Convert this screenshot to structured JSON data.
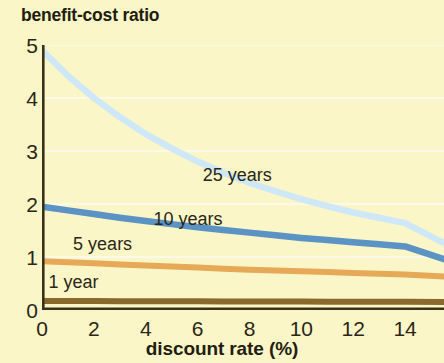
{
  "chart_data": {
    "type": "line",
    "title": "benefit-cost ratio",
    "subtitle": "",
    "xlabel": "discount rate (%)",
    "ylabel": "benefit-cost ratio",
    "xlim": [
      0,
      15.5
    ],
    "ylim": [
      0,
      5
    ],
    "xticks": [
      0,
      2,
      4,
      6,
      8,
      10,
      12,
      14
    ],
    "yticks": [
      0,
      1,
      2,
      3,
      4,
      5
    ],
    "xtick_labels": [
      "0",
      "2",
      "4",
      "6",
      "8",
      "10",
      "12",
      "14"
    ],
    "ytick_labels": [
      "0",
      "1",
      "2",
      "3",
      "4",
      "5"
    ],
    "grid": "horizontal-faint-white",
    "legend_position": "inline-annotations",
    "background_color": "#fbf6c8",
    "axis_color": "#3a3218",
    "x": [
      0,
      1,
      2,
      3,
      4,
      5,
      6,
      7,
      8,
      9,
      10,
      11,
      12,
      13,
      14,
      15.5
    ],
    "series": [
      {
        "name": "25 years",
        "label": "25 years",
        "color": "#cfe8f7",
        "values": [
          4.9,
          4.42,
          4.0,
          3.64,
          3.32,
          3.05,
          2.8,
          2.59,
          2.4,
          2.24,
          2.09,
          1.96,
          1.84,
          1.74,
          1.64,
          1.26
        ]
      },
      {
        "name": "10 years",
        "label": "10 years",
        "color": "#5a93c4",
        "values": [
          1.95,
          1.88,
          1.81,
          1.74,
          1.68,
          1.62,
          1.56,
          1.51,
          1.46,
          1.41,
          1.36,
          1.32,
          1.28,
          1.24,
          1.2,
          0.96
        ]
      },
      {
        "name": "5 years",
        "label": "5 years",
        "color": "#e6a958",
        "values": [
          0.92,
          0.9,
          0.88,
          0.86,
          0.84,
          0.82,
          0.8,
          0.78,
          0.76,
          0.745,
          0.73,
          0.715,
          0.7,
          0.685,
          0.67,
          0.63
        ]
      },
      {
        "name": "1 year",
        "label": "1 year",
        "color": "#8a6a2c",
        "values": [
          0.17,
          0.17,
          0.168,
          0.166,
          0.165,
          0.164,
          0.163,
          0.162,
          0.161,
          0.16,
          0.159,
          0.158,
          0.157,
          0.156,
          0.155,
          0.153
        ]
      }
    ],
    "annotations": [
      {
        "text": "25 years",
        "x_pct": 6.2,
        "y_value": 2.55
      },
      {
        "text": "10 years",
        "x_pct": 4.3,
        "y_value": 1.72
      },
      {
        "text": "5 years",
        "x_pct": 1.2,
        "y_value": 1.25
      },
      {
        "text": "1 year",
        "x_pct": 0.25,
        "y_value": 0.52
      }
    ]
  }
}
